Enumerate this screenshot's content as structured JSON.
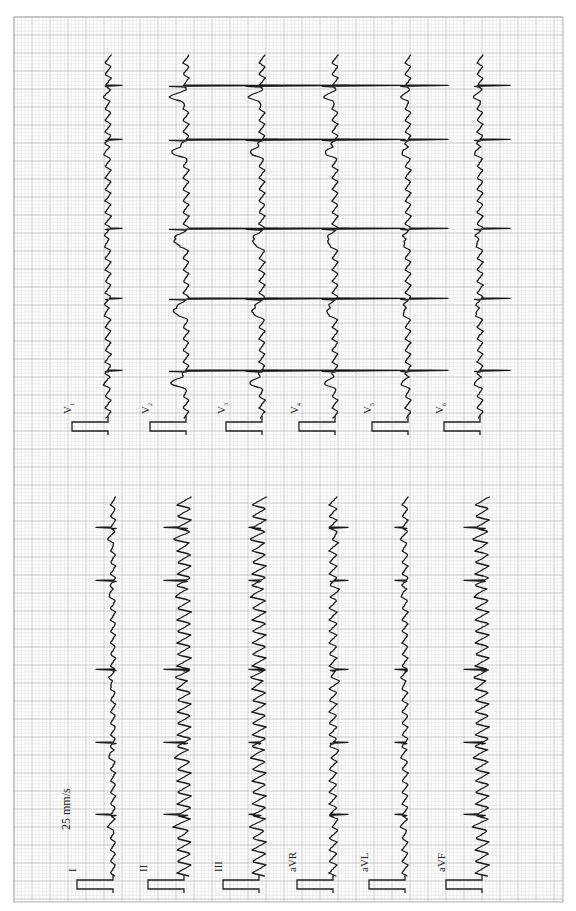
{
  "document": {
    "type": "12-lead electrocardiogram",
    "orientation": "rotated 90 degrees counter-clockwise",
    "paper_speed_label": "25 mm/s",
    "colors": {
      "background": "#ffffff",
      "grid_minor": "#e2e2e2",
      "grid_major": "#bdbdbd",
      "trace": "#1a1a1a"
    }
  },
  "grid": {
    "x0": 14,
    "y0": 17,
    "x1": 563,
    "y1": 902,
    "minor_spacing": 3.6,
    "major_spacing": 18
  },
  "limb_leads": {
    "y_start": 497,
    "y_end": 876,
    "beats_y": [
      527,
      580,
      669,
      742,
      814
    ],
    "leads": [
      {
        "name": "I",
        "label": "I",
        "sub": "",
        "baseline_x": 113,
        "qrs_amp": 17,
        "flutter_amp": 2.5,
        "t_amp": 3
      },
      {
        "name": "II",
        "label": "II",
        "sub": "",
        "baseline_x": 184,
        "qrs_amp": 20,
        "flutter_amp": 7,
        "t_amp": 4
      },
      {
        "name": "III",
        "label": "III",
        "sub": "",
        "baseline_x": 259,
        "qrs_amp": 10,
        "flutter_amp": 7,
        "t_amp": 3
      },
      {
        "name": "aVR",
        "label": "aVR",
        "sub": "",
        "baseline_x": 333,
        "qrs_amp": -15,
        "flutter_amp": 4,
        "t_amp": -3
      },
      {
        "name": "aVL",
        "label": "aVL",
        "sub": "",
        "baseline_x": 405,
        "qrs_amp": 10,
        "flutter_amp": 3,
        "t_amp": 2
      },
      {
        "name": "aVF",
        "label": "aVF",
        "sub": "",
        "baseline_x": 482,
        "qrs_amp": 18,
        "flutter_amp": 7,
        "t_amp": 3
      }
    ]
  },
  "chest_leads": {
    "y_start": 55,
    "y_end": 418,
    "beats_y": [
      85,
      139,
      228,
      298,
      370
    ],
    "leads": [
      {
        "name": "V1",
        "label": "V",
        "sub": "1",
        "baseline_x": 108,
        "qrs_amp": -14,
        "flutter_amp": 3,
        "t_amp": 2
      },
      {
        "name": "V2",
        "label": "V",
        "sub": "2",
        "baseline_x": 186,
        "qrs_amp": -92,
        "flutter_amp": 3,
        "t_amp": 14
      },
      {
        "name": "V3",
        "label": "V",
        "sub": "3",
        "baseline_x": 262,
        "qrs_amp": -88,
        "flutter_amp": 3,
        "t_amp": 11
      },
      {
        "name": "V4",
        "label": "V",
        "sub": "4",
        "baseline_x": 335,
        "qrs_amp": -70,
        "flutter_amp": 3,
        "t_amp": 9
      },
      {
        "name": "V5",
        "label": "V",
        "sub": "5",
        "baseline_x": 408,
        "qrs_amp": -40,
        "flutter_amp": 3,
        "t_amp": 5
      },
      {
        "name": "V6",
        "label": "V",
        "sub": "6",
        "baseline_x": 480,
        "qrs_amp": -30,
        "flutter_amp": 3,
        "t_amp": 4
      }
    ]
  },
  "calibration": {
    "width_px": 36,
    "length_px": 9
  }
}
